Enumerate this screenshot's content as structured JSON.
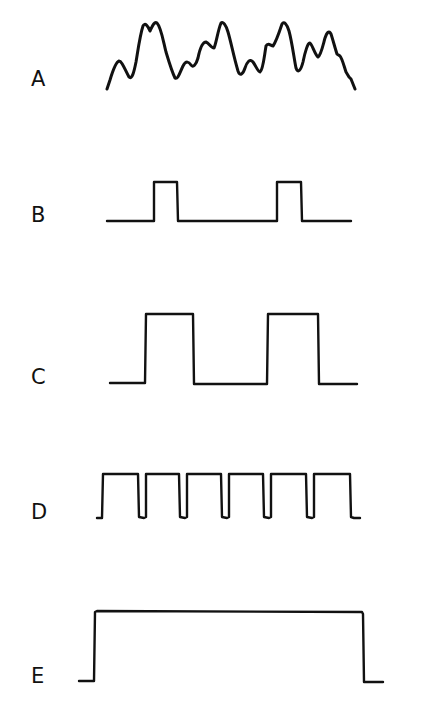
{
  "figure": {
    "colors": {
      "background": "#ffffff",
      "ink": "#111111"
    },
    "traces": [
      {
        "label": "A",
        "kind": "irregular-analog-signal",
        "label_pos": {
          "x": 32,
          "y": 69
        }
      },
      {
        "label": "B",
        "kind": "narrow-pulse-train",
        "pulses": 2,
        "label_pos": {
          "x": 31,
          "y": 205
        }
      },
      {
        "label": "C",
        "kind": "wide-pulse-train",
        "pulses": 2,
        "label_pos": {
          "x": 31,
          "y": 367
        }
      },
      {
        "label": "D",
        "kind": "high-duty-cycle-pulse-train",
        "pulses": 6,
        "label_pos": {
          "x": 31,
          "y": 502
        }
      },
      {
        "label": "E",
        "kind": "single-long-pulse",
        "pulses": 1,
        "label_pos": {
          "x": 31,
          "y": 666
        }
      }
    ]
  }
}
